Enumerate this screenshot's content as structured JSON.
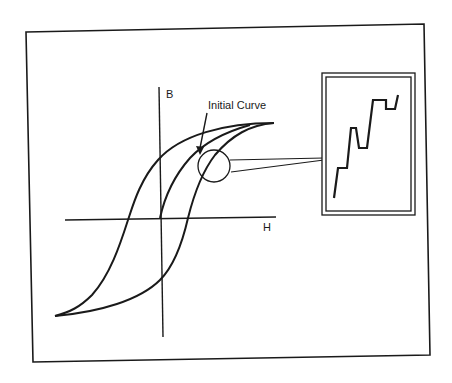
{
  "diagram": {
    "type": "magnetic hysteresis loop (B-H curve) with magnified inset",
    "axes": {
      "vertical_label": "B",
      "horizontal_label": "H"
    },
    "annotation": {
      "label": "Initial Curve",
      "arrow": "points to initial magnetization curve"
    },
    "magnifier": {
      "shape": "circle",
      "description": "circled region on initial curve enlarged in inset"
    },
    "inset": {
      "border": "double-line rectangle",
      "content": "stepped line showing discontinuous jumps (Barkhausen effect)"
    },
    "colors": {
      "stroke": "#1a1a1a",
      "background": "#ffffff"
    }
  }
}
